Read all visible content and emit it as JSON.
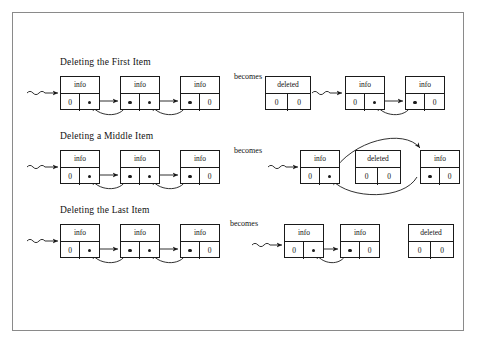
{
  "figure": {
    "kind": "doubly-linked-list-deletion-diagram",
    "frame": {
      "stroke": "#8a8a8a"
    },
    "line_color": "#1a1a1a",
    "null_value": "0",
    "info_label": "info",
    "deleted_label": "deleted",
    "becomes_label": "becomes"
  },
  "rows": [
    {
      "title": "Deleting the First Item",
      "becomes": "becomes",
      "before": {
        "head_marker": "wavy-arrow",
        "nodes": [
          {
            "info": "info",
            "left": "0",
            "right": "dot"
          },
          {
            "info": "info",
            "left": "dot",
            "right": "dot"
          },
          {
            "info": "info",
            "left": "dot",
            "right": "0"
          }
        ]
      },
      "after": {
        "deleted_node": {
          "info": "deleted",
          "left": "0",
          "right": "0"
        },
        "deleted_position": "left",
        "head_marker": "wavy-arrow",
        "nodes": [
          {
            "info": "info",
            "left": "0",
            "right": "dot"
          },
          {
            "info": "info",
            "left": "dot",
            "right": "0"
          }
        ]
      }
    },
    {
      "title": "Deleting a Middle Item",
      "becomes": "becomes",
      "before": {
        "head_marker": "wavy-arrow",
        "nodes": [
          {
            "info": "info",
            "left": "0",
            "right": "dot"
          },
          {
            "info": "info",
            "left": "dot",
            "right": "dot"
          },
          {
            "info": "info",
            "left": "dot",
            "right": "0"
          }
        ]
      },
      "after": {
        "deleted_node": {
          "info": "deleted",
          "left": "0",
          "right": "0"
        },
        "deleted_position": "middle",
        "head_marker": "wavy-arrow",
        "nodes": [
          {
            "info": "info",
            "left": "0",
            "right": "dot"
          },
          {
            "info": "info",
            "left": "dot",
            "right": "0"
          }
        ]
      }
    },
    {
      "title": "Deleting the Last Item",
      "becomes": "becomes",
      "before": {
        "head_marker": "wavy-arrow",
        "nodes": [
          {
            "info": "info",
            "left": "0",
            "right": "dot"
          },
          {
            "info": "info",
            "left": "dot",
            "right": "dot"
          },
          {
            "info": "info",
            "left": "dot",
            "right": "0"
          }
        ]
      },
      "after": {
        "deleted_node": {
          "info": "deleted",
          "left": "0",
          "right": "0"
        },
        "deleted_position": "right",
        "head_marker": "wavy-arrow",
        "nodes": [
          {
            "info": "info",
            "left": "0",
            "right": "dot"
          },
          {
            "info": "info",
            "left": "dot",
            "right": "0"
          }
        ]
      }
    }
  ]
}
